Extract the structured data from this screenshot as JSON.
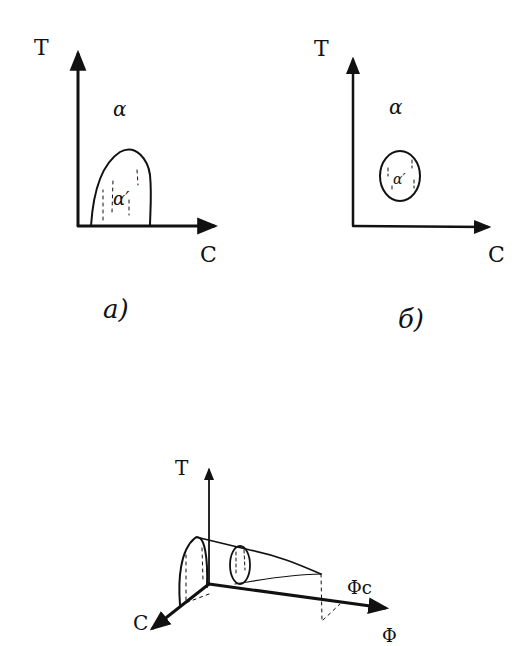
{
  "panel_a": {
    "y_axis_label": "T",
    "x_axis_label": "C",
    "outer_phase_label": "α",
    "inner_phase_label": "α′",
    "caption": "a)"
  },
  "panel_b": {
    "y_axis_label": "T",
    "x_axis_label": "C",
    "outer_phase_label": "α",
    "inner_phase_label": "α′",
    "caption": "б)"
  },
  "panel_3d": {
    "vertical_axis_label": "T",
    "left_axis_label": "C",
    "right_axis_label": "Φ",
    "critical_point_label": "Φc"
  },
  "colors": {
    "ink": "#111111",
    "paper": "#ffffff"
  }
}
